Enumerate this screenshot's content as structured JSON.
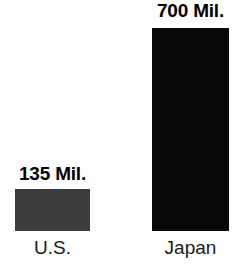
{
  "chart_data": {
    "type": "bar",
    "title": "",
    "subtitle": "",
    "xlabel": "",
    "ylabel": "",
    "unit": "Mil.",
    "grid": false,
    "legend": null,
    "orientation": "vertical",
    "categories": [
      "U.S.",
      "Japan"
    ],
    "values": [
      135,
      700
    ],
    "data_labels": [
      "135 Mil.",
      "700 Mil."
    ],
    "series": [
      {
        "name": "",
        "points": [
          {
            "category": "U.S.",
            "value": 135,
            "data_label": "135 Mil.",
            "color": "#3d3d3d",
            "bar_height_px": 42
          },
          {
            "category": "Japan",
            "value": 700,
            "data_label": "700 Mil.",
            "color": "#080808",
            "bar_height_px": 203
          }
        ]
      }
    ],
    "colors": {
      "background": "#ffffff",
      "bar_us": "#3d3d3d",
      "bar_japan": "#080808",
      "value_label_text": "#000000",
      "category_label_text": "#1a1a1a"
    }
  }
}
